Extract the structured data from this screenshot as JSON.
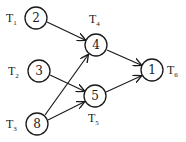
{
  "diagram": {
    "type": "task-dependency-graph",
    "colors": {
      "stroke": "#1a1a1a",
      "background": "#ffffff"
    },
    "nodes": [
      {
        "id": "T1",
        "label": "T",
        "sub": "1",
        "weight": "2"
      },
      {
        "id": "T2",
        "label": "T",
        "sub": "2",
        "weight": "3"
      },
      {
        "id": "T3",
        "label": "T",
        "sub": "3",
        "weight": "8"
      },
      {
        "id": "T4",
        "label": "T",
        "sub": "4",
        "weight": "4"
      },
      {
        "id": "T5",
        "label": "T",
        "sub": "5",
        "weight": "5"
      },
      {
        "id": "T6",
        "label": "T",
        "sub": "6",
        "weight": "1"
      }
    ],
    "edges": [
      {
        "from": "T1",
        "to": "T4"
      },
      {
        "from": "T2",
        "to": "T5"
      },
      {
        "from": "T3",
        "to": "T4"
      },
      {
        "from": "T3",
        "to": "T5"
      },
      {
        "from": "T4",
        "to": "T6"
      },
      {
        "from": "T5",
        "to": "T6"
      }
    ]
  }
}
